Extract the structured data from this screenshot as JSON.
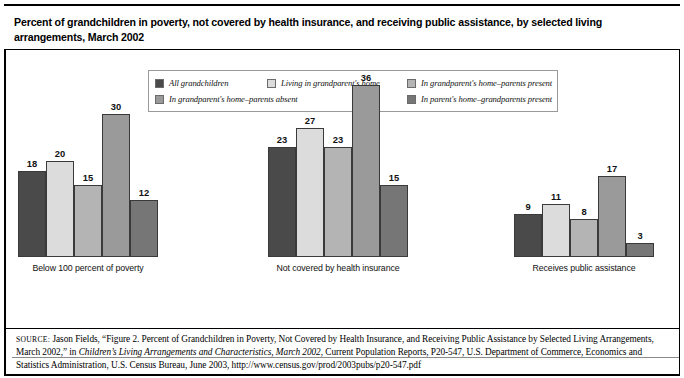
{
  "header": {
    "title": "Percent of grandchildren in poverty, not covered by health insurance, and receiving public assistance, by selected living arrangements, March 2002"
  },
  "legend": {
    "items": [
      {
        "label": "All grandchildren",
        "color": "#4a4a4a"
      },
      {
        "label": "Living in grandparent's home",
        "color": "#dcdcdc"
      },
      {
        "label": "In grandparent's home–parents present",
        "color": "#b4b4b4"
      },
      {
        "label": "In grandparent's home–parents absent",
        "color": "#9a9a9a"
      },
      {
        "label": "In parent's home–grandparents present",
        "color": "#767676"
      }
    ]
  },
  "chart_data": {
    "type": "bar",
    "title": "Percent of grandchildren in poverty, not covered by health insurance, and receiving public assistance, by selected living arrangements, March 2002",
    "xlabel": "",
    "ylabel": "",
    "ylim": [
      0,
      40
    ],
    "grid": false,
    "legend_position": "top",
    "categories": [
      "Below 100 percent of poverty",
      "Not covered by health insurance",
      "Receives public assistance"
    ],
    "series": [
      {
        "name": "All grandchildren",
        "color": "#4a4a4a",
        "values": [
          18,
          23,
          9
        ]
      },
      {
        "name": "Living in grandparent's home",
        "color": "#dcdcdc",
        "values": [
          20,
          27,
          11
        ]
      },
      {
        "name": "In grandparent's home–parents present",
        "color": "#b4b4b4",
        "values": [
          15,
          23,
          8
        ]
      },
      {
        "name": "In grandparent's home–parents absent",
        "color": "#9a9a9a",
        "values": [
          30,
          36,
          17
        ]
      },
      {
        "name": "In parent's home–grandparents present",
        "color": "#767676",
        "values": [
          12,
          15,
          3
        ]
      }
    ]
  },
  "source": {
    "label": "SOURCE:",
    "line_plain_1": " Jason Fields, “Figure 2. Percent of Grandchildren in Poverty, Not Covered by Health Insurance, and Receiving Public Assistance by Selected Living Arrangements, March 2002,” in ",
    "italic_1": "Children’s Living Arrangements and Characteristics, March 2002",
    "line_plain_2": ", Current Population Reports, P20-547, U.S. Department of Commerce, Economics and Statistics Administration, U.S. Census Bureau, June 2003, http://www.census.gov/prod/2003pubs/p20-547.pdf"
  }
}
